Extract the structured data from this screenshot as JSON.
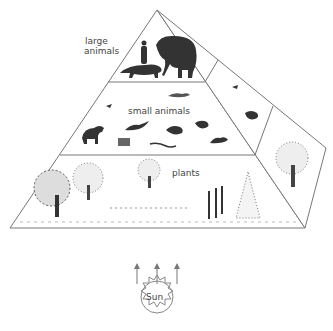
{
  "diagram": {
    "type": "ecological energy pyramid",
    "labels": {
      "top_tier": "large animals",
      "top_tier_line1": "large",
      "top_tier_line2": "animals",
      "middle_tier": "small animals",
      "bottom_tier": "plants",
      "energy_source": "Sun"
    },
    "tiers": [
      {
        "name": "large animals",
        "contents": [
          "person",
          "elephant",
          "big cat"
        ]
      },
      {
        "name": "small animals",
        "contents": [
          "bird",
          "dog",
          "weasel",
          "small cat",
          "snake",
          "badger",
          "rodent",
          "frog",
          "rabbit",
          "lizard",
          "raccoon"
        ]
      },
      {
        "name": "plants",
        "contents": [
          "deciduous trees",
          "shrubs",
          "grasses",
          "corn stalks",
          "conifer"
        ]
      }
    ],
    "arrows": {
      "count": 3,
      "direction": "up",
      "from": "Sun",
      "to": "plants"
    },
    "colors": {
      "line": "#777777",
      "ink": "#2a2a2a",
      "background": "#ffffff"
    }
  }
}
